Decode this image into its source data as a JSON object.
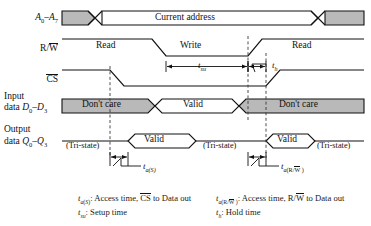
{
  "diagram": {
    "type": "timing-diagram",
    "colors": {
      "line": "#111111",
      "fill_dontcare": "#b3b3b3",
      "background": "#ffffff",
      "dashed": "#444444"
    },
    "signals": [
      {
        "id": "address",
        "label_main": "A",
        "label_sub1": "0",
        "label_dash": "–",
        "label_main2": "A",
        "label_sub2": "7",
        "label_plain": "A0–A7",
        "y": 18,
        "segments": [
          {
            "kind": "dontcare",
            "x1": 62,
            "x2": 88
          },
          {
            "kind": "crossover",
            "x": 95
          },
          {
            "kind": "valid",
            "x1": 88,
            "x2": 316,
            "text": "Current address"
          },
          {
            "kind": "crossover",
            "x": 316
          },
          {
            "kind": "dontcare",
            "x1": 323,
            "x2": 356
          }
        ]
      },
      {
        "id": "rw",
        "label_plain": "R/W",
        "label_pre": "R/",
        "label_overline": "W",
        "y": 48,
        "level_texts": [
          {
            "text": "Read",
            "x": 110
          },
          {
            "text": "Write",
            "x": 200
          },
          {
            "text": "Read",
            "x": 290
          }
        ]
      },
      {
        "id": "cs",
        "label_plain": "CS",
        "label_overline": "CS",
        "y": 78
      },
      {
        "id": "input_data",
        "label_line1": "Input",
        "label_line2_pre": "data ",
        "label_plain": "data D0–D3",
        "label_sym": "D",
        "label_sub1": "0",
        "label_sub2": "3",
        "y": 105,
        "segments": [
          {
            "kind": "dontcare",
            "text": "Don't care",
            "x1": 62,
            "x2": 148
          },
          {
            "kind": "valid",
            "text": "Valid",
            "x1": 152,
            "x2": 232
          },
          {
            "kind": "dontcare",
            "text": "Don't care",
            "x1": 238,
            "x2": 356
          }
        ]
      },
      {
        "id": "output_data",
        "label_line1": "Output",
        "label_line2_pre": "data ",
        "label_plain": "data Q0–Q3",
        "label_sym": "Q",
        "label_sub1": "0",
        "label_sub2": "3",
        "y": 140,
        "segments": [
          {
            "kind": "tristate",
            "text": "(Tri-state)",
            "x": 95
          },
          {
            "kind": "valid",
            "text": "Valid",
            "x1": 130,
            "x2": 196
          },
          {
            "kind": "tristate",
            "text": "(Tri-state)",
            "x": 232
          },
          {
            "kind": "valid2",
            "text": "Valid",
            "x1": 270,
            "x2": 310
          },
          {
            "kind": "tristate",
            "text": "(Tri-state)",
            "x": 330
          }
        ]
      }
    ],
    "measurements": [
      {
        "id": "t_su",
        "sym": "t",
        "sub": "su",
        "label": "tsu",
        "x": 200,
        "y": 66
      },
      {
        "id": "t_h",
        "sym": "t",
        "sub": "h",
        "label": "th",
        "x": 272,
        "y": 66
      },
      {
        "id": "t_aS",
        "sym": "t",
        "sub": "a(S)",
        "label": "ta(S)",
        "x": 160,
        "y": 163
      },
      {
        "id": "t_aRW",
        "sym": "t",
        "sub": "a(R/W)",
        "label": "ta(R/W)",
        "x": 300,
        "y": 163
      }
    ],
    "captions": [
      {
        "id": "cap-access-cs",
        "sym": "t",
        "sub": "a(S)",
        "text_pre": ": Access time, ",
        "overline": "CS",
        "text_post": " to Data out"
      },
      {
        "id": "cap-setup",
        "sym": "t",
        "sub": "su",
        "text_pre": ": Setup time",
        "overline": "",
        "text_post": ""
      },
      {
        "id": "cap-access-rw",
        "sym": "t",
        "sub": "a(R/W )",
        "text_pre": ": Access time, R/",
        "overline": "W",
        "text_post": " to Data out"
      },
      {
        "id": "cap-hold",
        "sym": "t",
        "sub": "h",
        "text_pre": ": Hold time",
        "overline": "",
        "text_post": ""
      }
    ],
    "dashed_lines": [
      {
        "id": "dashed-cs-fall",
        "x": 110
      },
      {
        "id": "dashed-rw-rise",
        "x": 248
      },
      {
        "id": "dashed-data-end",
        "x": 266
      }
    ]
  }
}
